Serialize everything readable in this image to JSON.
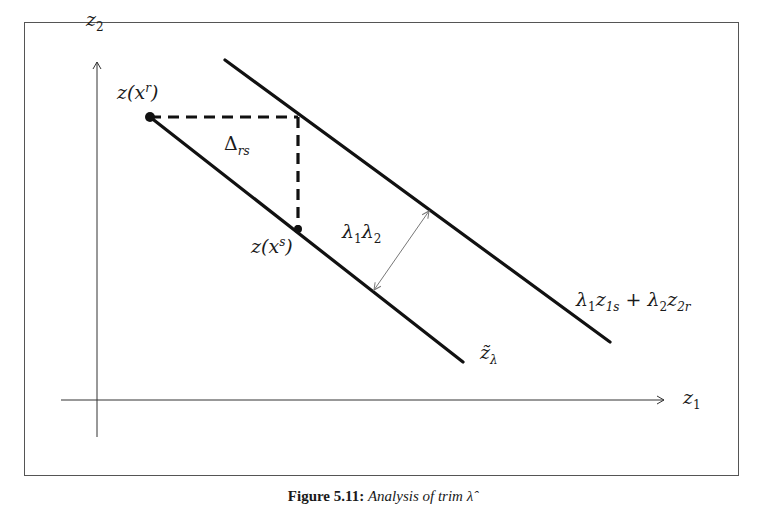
{
  "figure": {
    "caption_number": "Figure 5.11:",
    "caption_text": "Analysis of trim λ̂",
    "colors": {
      "line": "#111111",
      "axis": "#333333",
      "frame": "#555555",
      "arrow": "#777777"
    }
  },
  "axes": {
    "x_label": "z",
    "x_sub": "1",
    "y_label": "z",
    "y_sub": "2"
  },
  "labels": {
    "point_r": {
      "base": "z(x",
      "sup": "r",
      "close": ")"
    },
    "point_s": {
      "base": "z(x",
      "sup": "s",
      "close": ")"
    },
    "delta": {
      "base": "Δ",
      "sub": "rs"
    },
    "distance": {
      "l1": "λ",
      "s1": "1",
      "l2": "λ",
      "s2": "2"
    },
    "upper_line": {
      "a": "λ",
      "a_sub": "1",
      "b": "z",
      "b_sub": "1s",
      "plus": " + ",
      "c": "λ",
      "c_sub": "2",
      "d": "z",
      "d_sub": "2r"
    },
    "lower_line": {
      "base": "z̃",
      "sub": "λ"
    }
  }
}
